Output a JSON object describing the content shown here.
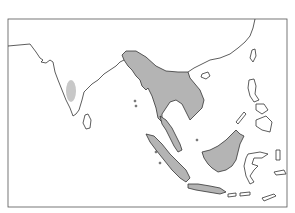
{
  "map": {
    "type": "species distribution map",
    "region": "South and Southeast Asia",
    "colors": {
      "range_fill": "#b4b4b4",
      "range_fill_light": "#c8c8c8",
      "coastline": "#333333",
      "background": "#ffffff"
    },
    "range_areas": [
      "Western Ghats (southern India)",
      "Northeast India / Myanmar / Thailand / Indochina",
      "Malay Peninsula",
      "Sumatra",
      "Borneo",
      "Java"
    ]
  }
}
